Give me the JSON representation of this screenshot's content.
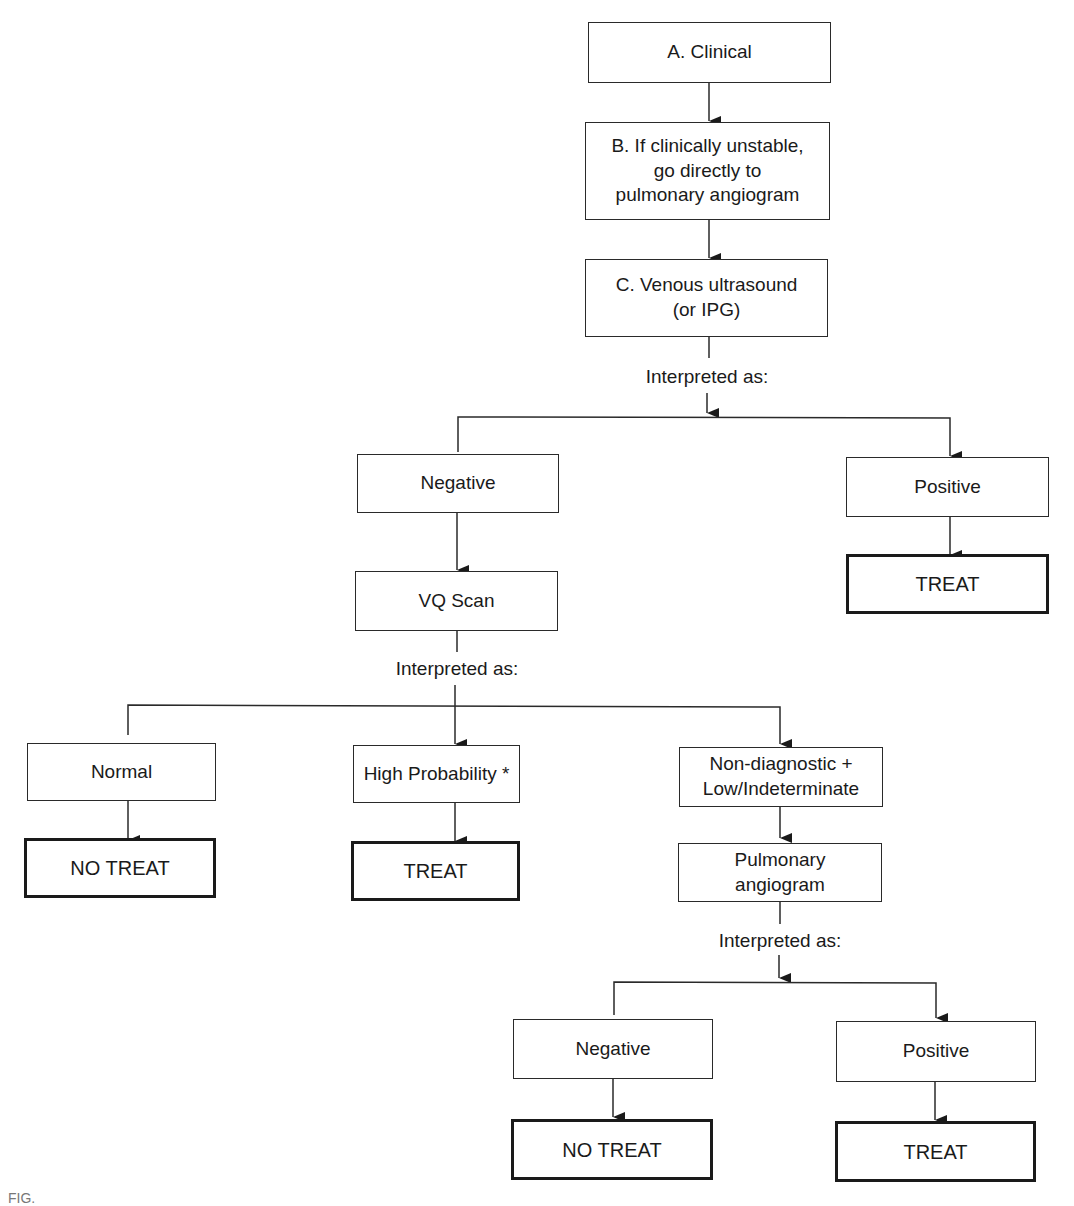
{
  "diagram": {
    "type": "flowchart",
    "nodes": {
      "clinical": "A. Clinical",
      "unstable": "B. If clinically unstable,\ngo directly to\npulmonary angiogram",
      "venous_us": "C. Venous ultrasound\n(or IPG)",
      "us_negative": "Negative",
      "us_positive": "Positive",
      "us_positive_treat": "TREAT",
      "vq_scan": "VQ Scan",
      "vq_normal": "Normal",
      "vq_normal_result": "NO TREAT",
      "vq_high": "High Probability *",
      "vq_high_result": "TREAT",
      "vq_nondiag": "Non-diagnostic +\nLow/Indeterminate",
      "pulm_angio": "Pulmonary\nangiogram",
      "angio_negative": "Negative",
      "angio_negative_result": "NO TREAT",
      "angio_positive": "Positive",
      "angio_positive_result": "TREAT"
    },
    "labels": {
      "interpret_us": "Interpreted as:",
      "interpret_vq": "Interpreted as:",
      "interpret_angio": "Interpreted as:"
    },
    "edges": [
      [
        "clinical",
        "unstable"
      ],
      [
        "unstable",
        "venous_us"
      ],
      [
        "venous_us",
        "us_negative"
      ],
      [
        "venous_us",
        "us_positive"
      ],
      [
        "us_positive",
        "us_positive_treat"
      ],
      [
        "us_negative",
        "vq_scan"
      ],
      [
        "vq_scan",
        "vq_normal"
      ],
      [
        "vq_scan",
        "vq_high"
      ],
      [
        "vq_scan",
        "vq_nondiag"
      ],
      [
        "vq_normal",
        "vq_normal_result"
      ],
      [
        "vq_high",
        "vq_high_result"
      ],
      [
        "vq_nondiag",
        "pulm_angio"
      ],
      [
        "pulm_angio",
        "angio_negative"
      ],
      [
        "pulm_angio",
        "angio_positive"
      ],
      [
        "angio_negative",
        "angio_negative_result"
      ],
      [
        "angio_positive",
        "angio_positive_result"
      ]
    ],
    "caption": "FIG."
  }
}
